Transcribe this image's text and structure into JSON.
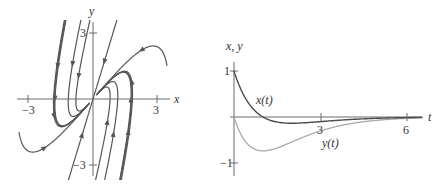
{
  "colors": {
    "axis": "#6b6b6b",
    "trajectory": "#555555",
    "x_curve": "#4a4a4a",
    "y_curve": "#a8a8a8",
    "text": "#333333"
  },
  "phase_portrait": {
    "origin_px": [
      93,
      99
    ],
    "scale_px_per_unit": 21.5,
    "x_axis": {
      "label": "x",
      "range": [
        -3.5,
        3.6
      ],
      "ticks": [
        {
          "value": -3,
          "label": "−3"
        },
        {
          "value": 3,
          "label": "3"
        }
      ]
    },
    "y_axis": {
      "label": "y",
      "range": [
        -3.5,
        3.6
      ],
      "ticks": [
        {
          "value": 3,
          "label": "3"
        },
        {
          "value": -3,
          "label": "−3"
        }
      ]
    },
    "eigen_line": {
      "slope": 3.3,
      "direction": "inward"
    },
    "trajectory_count": 12
  },
  "chart_data": {
    "type": "line",
    "title": "",
    "xlabel": "t",
    "ylabel": "x, y",
    "xlim": [
      0,
      6.6
    ],
    "ylim": [
      -1.2,
      1.3
    ],
    "x_ticks": [
      3,
      6
    ],
    "y_ticks": [
      1,
      -1
    ],
    "series": [
      {
        "name": "x(t)",
        "label": "x(t)",
        "formula": "(1 - t) e^(-t)",
        "x": [
          0,
          0.25,
          0.5,
          0.75,
          1,
          1.5,
          2,
          2.5,
          3,
          3.5,
          4,
          4.5,
          5,
          5.5,
          6,
          6.5
        ],
        "values": [
          1,
          0.58,
          0.3,
          0.12,
          0,
          -0.11,
          -0.135,
          -0.12,
          -0.1,
          -0.08,
          -0.055,
          -0.039,
          -0.027,
          -0.018,
          -0.012,
          -0.008
        ]
      },
      {
        "name": "y(t)",
        "label": "y(t)",
        "formula": "-2t e^(-t)",
        "x": [
          0,
          0.25,
          0.5,
          0.75,
          1,
          1.5,
          2,
          2.5,
          3,
          3.5,
          4,
          4.5,
          5,
          5.5,
          6,
          6.5
        ],
        "values": [
          0,
          -0.39,
          -0.61,
          -0.71,
          -0.74,
          -0.67,
          -0.54,
          -0.41,
          -0.3,
          -0.21,
          -0.15,
          -0.1,
          -0.067,
          -0.045,
          -0.03,
          -0.02
        ]
      }
    ],
    "legend": "inline labels",
    "grid": false
  },
  "time_plot": {
    "origin_px": [
      234,
      117
    ],
    "px_per_t": 29,
    "px_per_unit_y": 46,
    "t_label": "t",
    "y_label": "x, y",
    "tick_labels": {
      "t3": "3",
      "t6": "6",
      "y1": "1",
      "yneg1": "−1"
    },
    "x_curve_label": "x(t)",
    "y_curve_label": "y(t)"
  }
}
